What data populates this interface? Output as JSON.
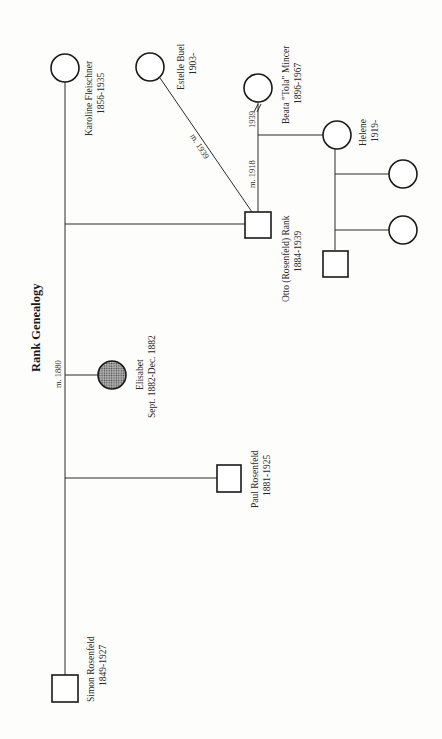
{
  "title": "Rank Genealogy",
  "people": {
    "simon": {
      "name": "Simon Rosenfeld",
      "dates": "1849-1927",
      "sex": "male"
    },
    "karoline": {
      "name": "Karoline Fleischner",
      "dates": "1856-1935",
      "sex": "female"
    },
    "paul": {
      "name": "Paul Rosenfeld",
      "dates": "1881-1925",
      "sex": "male"
    },
    "elisabet": {
      "name": "Elisabet",
      "dates": "Sept. 1882-Dec. 1882",
      "sex": "female",
      "deceased_infant": true
    },
    "otto": {
      "name": "Otto (Rosenfeld) Rank",
      "dates": "1884-1939",
      "sex": "male"
    },
    "estelle": {
      "name": "Estelle Buel",
      "dates": "1903-",
      "sex": "female"
    },
    "beata": {
      "name": "Beata \"Tola\" Mincer",
      "dates": "1896-1967",
      "sex": "female"
    },
    "helene": {
      "name": "Helene",
      "dates": "1919-",
      "sex": "female"
    },
    "grandchild_1": {
      "sex": "female"
    },
    "grandchild_2": {
      "sex": "female"
    },
    "grandchild_3": {
      "sex": "male"
    }
  },
  "relations": {
    "simon_karoline": "m. 1880",
    "otto_beata_marriage": "m. 1918",
    "otto_beata_divorce": "1939",
    "otto_estelle": "m. 1939"
  },
  "colors": {
    "line": "#2a2a2a",
    "background": "#fdfdfb",
    "deceased_fill": "#8a8a8a"
  }
}
